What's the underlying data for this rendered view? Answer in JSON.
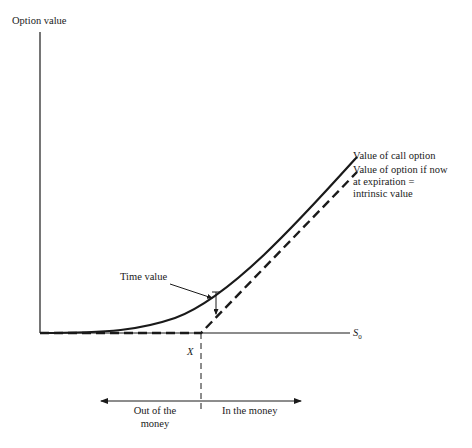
{
  "diagram": {
    "y_axis_label": "Option value",
    "x_axis_label": "S",
    "x_axis_label_subscript": "0",
    "strike_label": "X",
    "time_value_label": "Time value",
    "call_curve_label": "Value of call option",
    "intrinsic_label_line1": "Value of option if now",
    "intrinsic_label_line2": "at expiration =",
    "intrinsic_label_line3": "intrinsic value",
    "out_of_money_line1": "Out of the",
    "out_of_money_line2": "money",
    "in_the_money": "In the money",
    "colors": {
      "line": "#1a1a1a",
      "background": "#ffffff"
    }
  }
}
